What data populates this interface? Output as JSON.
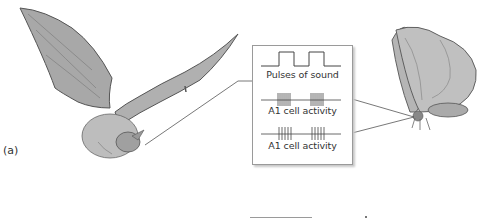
{
  "figure": {
    "panel_label": "(a)",
    "subjects": [
      "bat",
      "moth"
    ],
    "inset": {
      "traces": [
        {
          "kind": "pulses",
          "label": "Pulses of sound",
          "pulse_count": 2
        },
        {
          "kind": "spikes",
          "label": "A1 cell activity",
          "burst_count": 2
        },
        {
          "kind": "spikes",
          "label": "A1 cell activity",
          "burst_count": 2
        }
      ]
    },
    "colors": {
      "line": "#555555",
      "box_border": "#9a9a9a",
      "illustration": "#7a7a7a"
    }
  }
}
